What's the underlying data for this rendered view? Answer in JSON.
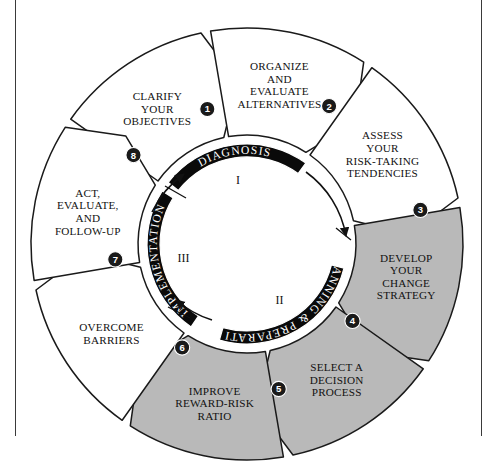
{
  "diagram": {
    "colors": {
      "wedge_white": "#ffffff",
      "wedge_gray": "#b9b9b9",
      "outline": "#1a1a1a",
      "arc_fill": "#0a0a0a",
      "arc_text": "#ffffff",
      "page_rule": "#3a3a3a"
    },
    "steps": [
      {
        "number": "1",
        "badge": "❶",
        "lines": [
          "CLARIFY",
          "YOUR",
          "OBJECTIVES"
        ],
        "shaded": false
      },
      {
        "number": "2",
        "badge": "❷",
        "lines": [
          "ORGANIZE",
          "AND",
          "EVALUATE",
          "ALTERNATIVES"
        ],
        "shaded": false
      },
      {
        "number": "3",
        "badge": "❸",
        "lines": [
          "ASSESS",
          "YOUR",
          "RISK-TAKING",
          "TENDENCIES"
        ],
        "shaded": false
      },
      {
        "number": "4",
        "badge": "❹",
        "lines": [
          "DEVELOP",
          "YOUR",
          "CHANGE",
          "STRATEGY"
        ],
        "shaded": true
      },
      {
        "number": "5",
        "badge": "❺",
        "lines": [
          "SELECT A",
          "DECISION",
          "PROCESS"
        ],
        "shaded": true
      },
      {
        "number": "6",
        "badge": "❻",
        "lines": [
          "IMPROVE",
          "REWARD-RISK",
          "RATIO"
        ],
        "shaded": true
      },
      {
        "number": "7",
        "badge": "❼",
        "lines": [
          "OVERCOME",
          "BARRIERS"
        ],
        "shaded": false
      },
      {
        "number": "8",
        "badge": "❽",
        "lines": [
          "ACT,",
          "EVALUATE,",
          "AND",
          "FOLLOW-UP"
        ],
        "shaded": false
      }
    ],
    "phases": [
      {
        "label": "DIAGNOSIS",
        "roman": "I"
      },
      {
        "label": "PLANNING & PREPARATION",
        "roman": "II"
      },
      {
        "label": "IMPLEMENTATION",
        "roman": "III"
      }
    ]
  }
}
